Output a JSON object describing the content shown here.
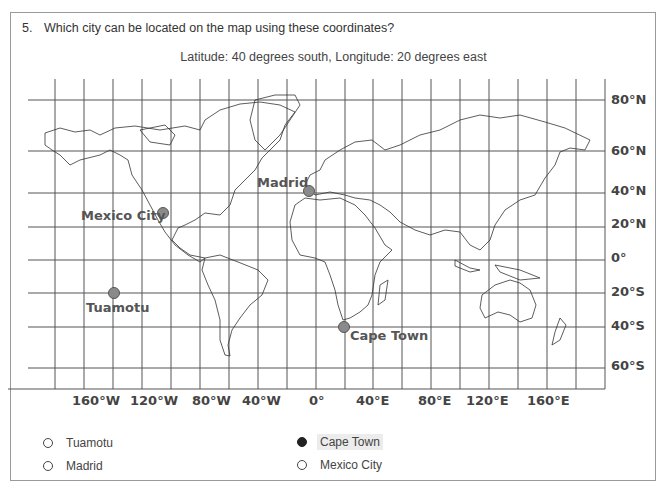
{
  "question": {
    "number": "5.",
    "text": "Which city can be located on the map using these coordinates?",
    "coordinates": "Latitude: 40 degrees south, Longitude: 20 degrees east"
  },
  "map": {
    "latitude_labels": [
      "80°N",
      "60°N",
      "40°N",
      "20°N",
      "0°",
      "20°S",
      "40°S",
      "60°S"
    ],
    "longitude_labels": [
      "160°W",
      "120°W",
      "80°W",
      "40°W",
      "0°",
      "40°E",
      "80°E",
      "120°E",
      "160°E"
    ],
    "cities": [
      {
        "name": "Madrid",
        "lat": "40°N",
        "lon": "0°"
      },
      {
        "name": "Mexico City",
        "lat": "20°N",
        "lon": "100°W"
      },
      {
        "name": "Tuamotu",
        "lat": "20°S",
        "lon": "140°W"
      },
      {
        "name": "Cape Town",
        "lat": "40°S",
        "lon": "20°E"
      }
    ],
    "dot_color": "#8a8a8a"
  },
  "options": [
    {
      "label": "Tuamotu",
      "selected": false
    },
    {
      "label": "Cape Town",
      "selected": true
    },
    {
      "label": "Madrid",
      "selected": false
    },
    {
      "label": "Mexico City",
      "selected": false
    }
  ]
}
